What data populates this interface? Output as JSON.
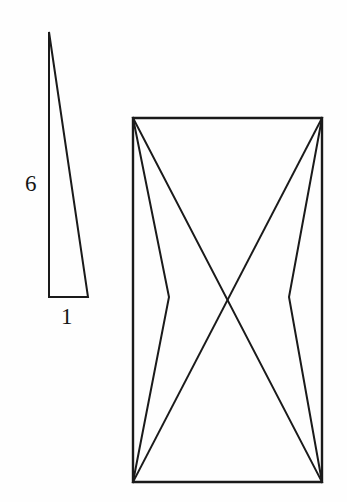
{
  "figure": {
    "background_color": "#fefefe",
    "stroke_color": "#1a1a1a",
    "stroke_width": 2,
    "width": 347,
    "height": 502,
    "caption": ""
  },
  "labels": {
    "height_label": "6",
    "base_label": "1"
  },
  "shapes": {
    "small_triangle": {
      "name": "thin-right-triangle",
      "points": "49,32 49,297 88,297",
      "apex": {
        "x": 49,
        "y": 32
      },
      "bottom_left": {
        "x": 49,
        "y": 297
      },
      "bottom_right": {
        "x": 88,
        "y": 297
      },
      "height_ratio": "6",
      "base_ratio": "1"
    },
    "rectangle": {
      "name": "bounding-rectangle",
      "points": "133,118 322,118 322,482 133,482",
      "top_left": {
        "x": 133,
        "y": 118
      },
      "top_right": {
        "x": 322,
        "y": 118
      },
      "bottom_right": {
        "x": 322,
        "y": 482
      },
      "bottom_left": {
        "x": 133,
        "y": 482
      }
    },
    "left_inner_triangle_upper": {
      "name": "left-upper-wedge",
      "points": "133,118 169,297 133,118"
    },
    "inner_left_chevron": {
      "name": "left-inscribed-chevron",
      "points": "133,118 169,297 133,482",
      "pinch": {
        "x": 169,
        "y": 297
      }
    },
    "inner_right_chevron": {
      "name": "right-inscribed-chevron",
      "points": "322,118 289,297 322,482",
      "pinch": {
        "x": 289,
        "y": 297
      }
    },
    "inner_diagonal_left": {
      "name": "left-to-right-diagonal",
      "points": "133,118 322,482"
    },
    "inner_diagonal_right": {
      "name": "right-to-left-diagonal",
      "points": "322,118 133,482"
    }
  }
}
